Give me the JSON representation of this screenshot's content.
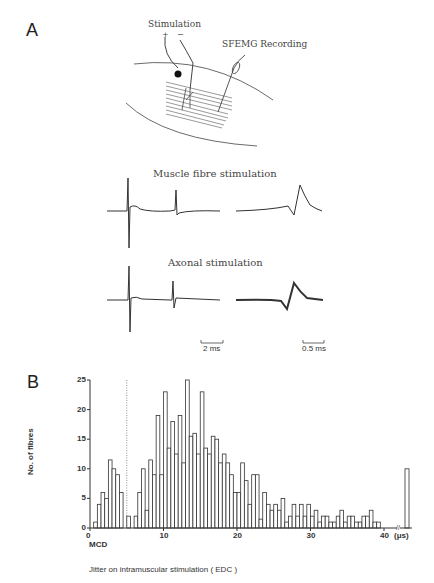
{
  "panel_a": {
    "label": "A",
    "diagram_labels": {
      "stimulation": "Stimulation",
      "plus": "+",
      "minus": "−",
      "recording": "SFEMG Recording"
    },
    "traces": {
      "muscle_title": "Muscle fibre stimulation",
      "axonal_title": "Axonal stimulation",
      "scale_left": "2 ms",
      "scale_right": "0.5 ms"
    }
  },
  "panel_b": {
    "label": "B"
  },
  "chart_data": {
    "type": "bar",
    "title": "",
    "xlabel": "Jitter on intramuscular stimulation ( EDC )",
    "ylabel": "No. of fibres",
    "x_unit": "(μs)",
    "x_marker_label": "MCD",
    "mcd_line_x": 5,
    "xlim": [
      0,
      40
    ],
    "ylim": [
      0,
      25
    ],
    "x_ticks": [
      0,
      10,
      20,
      30,
      40
    ],
    "y_ticks": [
      0,
      5,
      10,
      15,
      20,
      25
    ],
    "bin_width": 0.5,
    "grid": false,
    "bins_start": [
      0.5,
      1.0,
      1.5,
      2.0,
      2.5,
      3.0,
      3.5,
      4.0,
      5.0,
      6.0,
      6.5,
      7.0,
      7.5,
      8.0,
      8.5,
      9.0,
      9.5,
      10.0,
      10.5,
      11.0,
      11.5,
      12.0,
      12.5,
      13.0,
      13.5,
      14.0,
      14.5,
      15.0,
      15.5,
      16.0,
      16.5,
      17.0,
      17.5,
      18.0,
      18.5,
      19.0,
      19.5,
      20.0,
      20.5,
      21.0,
      21.5,
      22.0,
      22.5,
      23.0,
      23.5,
      24.0,
      24.5,
      25.0,
      25.5,
      26.0,
      26.5,
      27.0,
      27.5,
      28.0,
      28.5,
      29.0,
      29.5,
      30.0,
      30.5,
      31.0,
      31.5,
      32.0,
      32.5,
      33.0,
      33.5,
      34.0,
      34.5,
      35.0,
      35.5,
      36.0,
      36.5,
      37.0,
      37.5,
      38.0,
      38.5,
      39.0
    ],
    "values": [
      1,
      4,
      6,
      5,
      11.5,
      10,
      9,
      6,
      2,
      2,
      6,
      10,
      3,
      11.5,
      9,
      19,
      9,
      23,
      13.5,
      18,
      12.5,
      19,
      11,
      25,
      15.5,
      16,
      12.5,
      23,
      13.5,
      12.5,
      15.5,
      15,
      11,
      12.5,
      11,
      9,
      6,
      6,
      11,
      8,
      4,
      9,
      9,
      1.5,
      6,
      4,
      3,
      4,
      3,
      5,
      1,
      2,
      4,
      2,
      4,
      2,
      4,
      2,
      3,
      1,
      2,
      2,
      1,
      1,
      2,
      3,
      1,
      2,
      2,
      1,
      1,
      2,
      2,
      3,
      1,
      1
    ],
    "overflow_bar": {
      "label": "> 40 (beyond axis break)",
      "value": 10
    },
    "axis_break": "//"
  }
}
